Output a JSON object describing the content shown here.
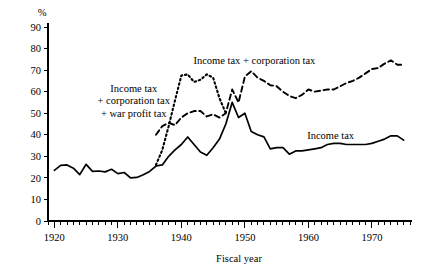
{
  "chart_data": {
    "type": "line",
    "title": "",
    "xlabel": "Fiscal year",
    "ylabel": "%",
    "xlim": [
      1919,
      1976
    ],
    "ylim": [
      0,
      90
    ],
    "grid": false,
    "legend_position": "inline-annotations",
    "x_ticks_major": [
      1920,
      1930,
      1940,
      1950,
      1960,
      1970
    ],
    "x_tick_labels": [
      "1920",
      "1930",
      "1940",
      "1950",
      "1960",
      "1970"
    ],
    "x_tick_minor_step": 1,
    "y_ticks": [
      0,
      10,
      20,
      30,
      40,
      50,
      60,
      70,
      80,
      90
    ],
    "y_tick_labels": [
      "0",
      "10",
      "20",
      "30",
      "40",
      "50",
      "60",
      "70",
      "80",
      "90"
    ],
    "annotations": [
      {
        "name": "income-corporation-war-profit-label",
        "lines": [
          "Income tax",
          "+ corporation tax",
          "+ war profit tax"
        ],
        "x": 1932.5,
        "y": 60
      },
      {
        "name": "income-corporation-label",
        "lines": [
          "Income tax + corporation tax"
        ],
        "x": 1951.5,
        "y": 73
      },
      {
        "name": "income-tax-label",
        "lines": [
          "Income tax"
        ],
        "x": 1963.5,
        "y": 38
      }
    ],
    "series": [
      {
        "name": "Income tax",
        "style": "solid",
        "x": [
          1920,
          1921,
          1922,
          1923,
          1924,
          1925,
          1926,
          1927,
          1928,
          1929,
          1930,
          1931,
          1932,
          1933,
          1934,
          1935,
          1936,
          1937,
          1938,
          1939,
          1940,
          1941,
          1942,
          1943,
          1944,
          1945,
          1946,
          1947,
          1948,
          1949,
          1950,
          1951,
          1952,
          1953,
          1954,
          1955,
          1956,
          1957,
          1958,
          1959,
          1960,
          1961,
          1962,
          1963,
          1964,
          1965,
          1966,
          1967,
          1968,
          1969,
          1970,
          1971,
          1972,
          1973,
          1974,
          1975
        ],
        "values": [
          23.5,
          25.8,
          26.0,
          24.5,
          21.5,
          26.3,
          23.0,
          23.2,
          22.8,
          24.0,
          22.0,
          22.5,
          20.0,
          20.2,
          21.5,
          23.0,
          25.5,
          26.0,
          30.0,
          33.0,
          35.5,
          39.0,
          35.5,
          32.0,
          30.5,
          34.0,
          38.0,
          45.0,
          55.0,
          48.0,
          50.0,
          41.5,
          40.0,
          39.0,
          33.5,
          34.0,
          34.0,
          31.0,
          32.5,
          32.5,
          33.0,
          33.5,
          34.0,
          35.5,
          36.0,
          36.0,
          35.5,
          35.5,
          35.5,
          35.5,
          36.0,
          37.0,
          38.0,
          39.5,
          39.5,
          37.5
        ]
      },
      {
        "name": "Income tax + corporation tax",
        "style": "dashed",
        "x": [
          1936,
          1937,
          1938,
          1939,
          1940,
          1941,
          1942,
          1943,
          1944,
          1945,
          1946,
          1947,
          1948,
          1949,
          1950,
          1951,
          1952,
          1953,
          1954,
          1955,
          1956,
          1957,
          1958,
          1959,
          1960,
          1961,
          1962,
          1963,
          1964,
          1965,
          1966,
          1967,
          1968,
          1969,
          1970,
          1971,
          1972,
          1973,
          1974,
          1975
        ],
        "values": [
          40.0,
          44.0,
          45.5,
          44.5,
          48.0,
          50.0,
          51.0,
          51.0,
          48.5,
          49.5,
          48.0,
          50.0,
          61.0,
          55.0,
          67.0,
          69.5,
          66.5,
          65.0,
          63.0,
          62.5,
          60.0,
          58.0,
          57.0,
          58.5,
          61.0,
          60.0,
          60.5,
          61.0,
          61.0,
          62.5,
          64.0,
          65.0,
          66.5,
          68.5,
          70.5,
          71.0,
          73.0,
          74.5,
          72.5,
          72.5
        ]
      },
      {
        "name": "Income tax + corporation tax + war profit tax",
        "style": "dotted",
        "x": [
          1936,
          1937,
          1938,
          1939,
          1940,
          1941,
          1942,
          1943,
          1944,
          1945,
          1946,
          1947
        ],
        "values": [
          26.0,
          33.0,
          44.0,
          56.0,
          67.5,
          68.0,
          64.5,
          65.5,
          68.0,
          66.5,
          57.0,
          50.0
        ]
      }
    ]
  }
}
